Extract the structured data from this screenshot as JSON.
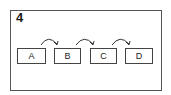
{
  "diagram": {
    "label": "4",
    "nodes": [
      {
        "id": "A",
        "label": "A"
      },
      {
        "id": "B",
        "label": "B"
      },
      {
        "id": "C",
        "label": "C"
      },
      {
        "id": "D",
        "label": "D"
      }
    ],
    "edges": [
      {
        "from": "A",
        "to": "B"
      },
      {
        "from": "B",
        "to": "C"
      },
      {
        "from": "C",
        "to": "D"
      }
    ]
  },
  "colors": {
    "stroke": "#444444",
    "background": "#ffffff",
    "text": "#222222"
  }
}
